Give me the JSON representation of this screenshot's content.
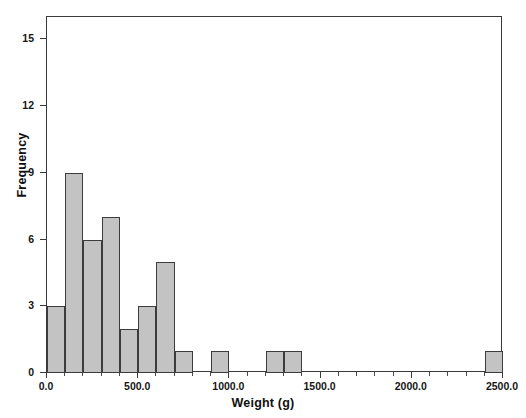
{
  "chart_data": {
    "type": "bar",
    "title": "",
    "subtitle": "",
    "xlabel": "Weight (g)",
    "ylabel": "Frequency",
    "xlim": [
      0,
      2500
    ],
    "ylim": [
      0,
      16
    ],
    "grid": false,
    "legend": null,
    "bin_width": 100,
    "x_tick_labels": [
      "0.0",
      "500.0",
      "1000.0",
      "1500.0",
      "2000.0",
      "2500.0"
    ],
    "x_tick_values": [
      0,
      500,
      1000,
      1500,
      2000,
      2500
    ],
    "y_tick_labels": [
      "0",
      "3",
      "6",
      "9",
      "12",
      "15"
    ],
    "y_tick_values": [
      0,
      3,
      6,
      9,
      12,
      15
    ],
    "bar_fill_color": "#c3c3c3",
    "bar_edge_color": "#3c3c3c",
    "frame_color": "#3a3a3a",
    "categories": [
      "0-100",
      "100-200",
      "200-300",
      "300-400",
      "400-500",
      "500-600",
      "600-700",
      "700-800",
      "800-900",
      "900-1000",
      "1000-1100",
      "1100-1200",
      "1200-1300",
      "1300-1400",
      "1400-1500",
      "1500-1600",
      "1600-1700",
      "1700-1800",
      "1800-1900",
      "1900-2000",
      "2000-2100",
      "2100-2200",
      "2200-2300",
      "2300-2400",
      "2400-2500"
    ],
    "values": [
      3,
      9,
      6,
      7,
      2,
      3,
      5,
      1,
      0,
      1,
      0,
      0,
      1,
      1,
      0,
      0,
      0,
      0,
      0,
      0,
      0,
      0,
      0,
      0,
      1
    ],
    "bars": [
      {
        "x0": 0,
        "x1": 100,
        "value": 3
      },
      {
        "x0": 100,
        "x1": 200,
        "value": 9
      },
      {
        "x0": 200,
        "x1": 300,
        "value": 6
      },
      {
        "x0": 300,
        "x1": 400,
        "value": 7
      },
      {
        "x0": 400,
        "x1": 500,
        "value": 2
      },
      {
        "x0": 500,
        "x1": 600,
        "value": 3
      },
      {
        "x0": 600,
        "x1": 700,
        "value": 5
      },
      {
        "x0": 700,
        "x1": 800,
        "value": 1
      },
      {
        "x0": 900,
        "x1": 1000,
        "value": 1
      },
      {
        "x0": 1200,
        "x1": 1300,
        "value": 1
      },
      {
        "x0": 1300,
        "x1": 1400,
        "value": 1
      },
      {
        "x0": 2400,
        "x1": 2500,
        "value": 1
      }
    ],
    "total_count": 40
  }
}
